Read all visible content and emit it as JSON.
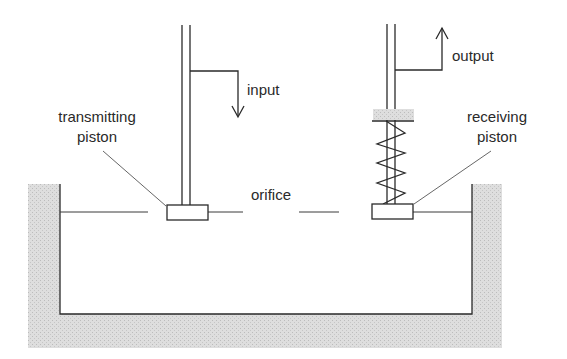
{
  "diagram": {
    "labels": {
      "input": "input",
      "output": "output",
      "transmitting_line1": "transmitting",
      "transmitting_line2": "piston",
      "receiving_line1": "receiving",
      "receiving_line2": "piston",
      "orifice": "orifice"
    },
    "colors": {
      "line": "#2a2a2a",
      "hatch": "#d9d9d9",
      "hatch_dot": "#bdbdbd",
      "background": "#ffffff"
    }
  }
}
